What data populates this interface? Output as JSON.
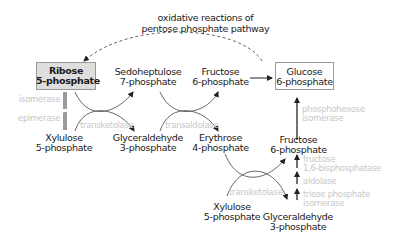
{
  "title": {
    "line1": "oxidative reactions of",
    "line2": "pentose phosphate pathway"
  },
  "metabolites": {
    "ribose_5p": {
      "line1": "Ribose",
      "line2": "5-phosphate",
      "highlighted": true
    },
    "sedoheptulose_7p": {
      "line1": "Sedoheptulose",
      "line2": "7-phosphate"
    },
    "fructose_6p_top": {
      "line1": "Fructose",
      "line2": "6-phosphate"
    },
    "glucose_6p": {
      "line1": "Glucose",
      "line2": "6-phosphate",
      "boxed": true
    },
    "xylulose_5p_left": {
      "line1": "Xylulose",
      "line2": "5-phosphate"
    },
    "glyceraldehyde_3p_mid": {
      "line1": "Glyceraldehyde",
      "line2": "3-phosphate"
    },
    "erythrose_4p": {
      "line1": "Erythrose",
      "line2": "4-phosphate"
    },
    "fructose_6p_right": {
      "line1": "Fructose",
      "line2": "6-phosphate"
    },
    "xylulose_5p_bottom": {
      "line1": "Xylulose",
      "line2": "5-phosphate"
    },
    "glyceraldehyde_3p_bottom": {
      "line1": "Glyceraldehyde",
      "line2": "3-phosphate"
    }
  },
  "enzymes": {
    "isomerase": "isomerase",
    "epimerase": "epimerase",
    "transketolase_1": "transketolase",
    "transaldolase": "transaldolase",
    "transketolase_2": "transketolase",
    "phosphohexose_isomerase": {
      "line1": "phosphohexose",
      "line2": "isomerase"
    },
    "fructose_bisphosphatase": {
      "line1": "fructose",
      "line2": "1,6-bisphosphatase"
    },
    "aldolase": "aldolase",
    "triose_phosphate_isomerase": {
      "line1": "triose phosphate",
      "line2": "isomerase"
    }
  },
  "colors": {
    "text": "#1a1a1a",
    "enzyme_text": "#c8c8c8",
    "ribose_box_fill": "#dedede",
    "box_border": "#9a9a9a",
    "arrow": "#333333",
    "curve": "#555555"
  }
}
